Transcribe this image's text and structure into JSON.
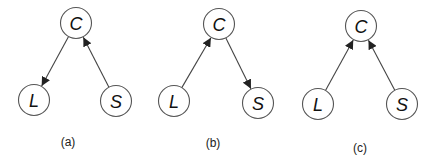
{
  "style": {
    "edge_color": "#444444",
    "node_stroke": "#555555",
    "node_fill": "#ffffff",
    "text_color": "#111111",
    "node_radius": 15.5
  },
  "panels": [
    {
      "id": "a",
      "caption": "(a)",
      "caption_pos": [
        68,
        142
      ],
      "nodes": [
        {
          "id": "C",
          "label": "C",
          "x": 76,
          "y": 23
        },
        {
          "id": "L",
          "label": "L",
          "x": 34,
          "y": 100
        },
        {
          "id": "S",
          "label": "S",
          "x": 116,
          "y": 101
        }
      ],
      "edges": [
        {
          "from": "C",
          "to": "L"
        },
        {
          "from": "S",
          "to": "C"
        }
      ]
    },
    {
      "id": "b",
      "caption": "(b)",
      "caption_pos": [
        213,
        143
      ],
      "nodes": [
        {
          "id": "C",
          "label": "C",
          "x": 219,
          "y": 24
        },
        {
          "id": "L",
          "label": "L",
          "x": 174,
          "y": 101
        },
        {
          "id": "S",
          "label": "S",
          "x": 258,
          "y": 103
        }
      ],
      "edges": [
        {
          "from": "L",
          "to": "C"
        },
        {
          "from": "C",
          "to": "S"
        }
      ]
    },
    {
      "id": "c",
      "caption": "(c)",
      "caption_pos": [
        360,
        148
      ],
      "nodes": [
        {
          "id": "C",
          "label": "C",
          "x": 361,
          "y": 26
        },
        {
          "id": "L",
          "label": "L",
          "x": 318,
          "y": 104
        },
        {
          "id": "S",
          "label": "S",
          "x": 402,
          "y": 104
        }
      ],
      "edges": [
        {
          "from": "L",
          "to": "C"
        },
        {
          "from": "S",
          "to": "C"
        }
      ]
    }
  ]
}
